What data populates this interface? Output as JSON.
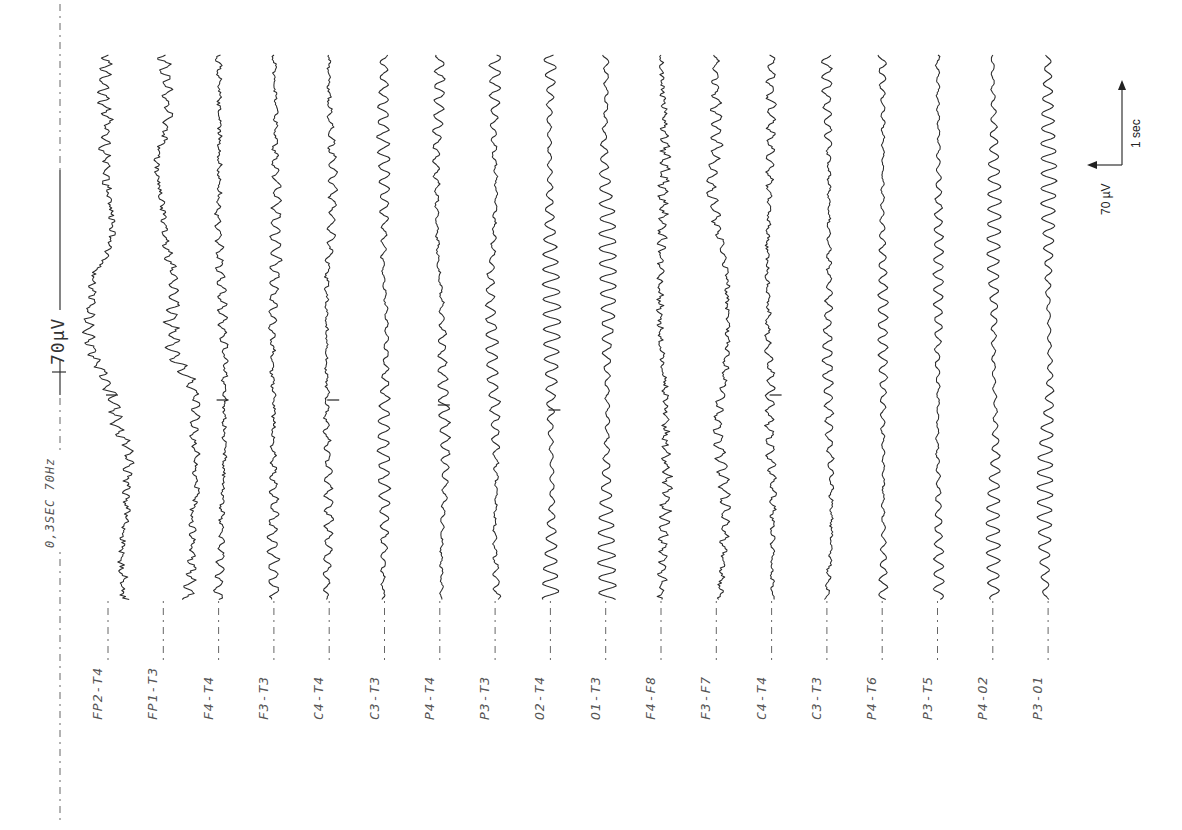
{
  "header": {
    "settings_text": "0,3SEC 70Hz",
    "calibration_text": "70µV"
  },
  "scale_bar": {
    "amplitude_label": "70 µV",
    "time_label": "1 sec"
  },
  "chart_data": {
    "type": "line",
    "orientation": "rotated-90-ccw",
    "time_constant": "0,3SEC",
    "high_filter": "70Hz",
    "calibration": "70µV",
    "scale_bar": {
      "amplitude_uV": 70,
      "time_sec": 1
    },
    "grid": false,
    "legend": "none",
    "channels": [
      {
        "label": "FP2-T4",
        "character": "low-amplitude fast activity with slow drift artifact",
        "amplitude": 5,
        "freq": 0.55,
        "noise": 0.9,
        "drift": 9,
        "mark": 395
      },
      {
        "label": "FP1-T3",
        "character": "mixed fast activity with slow eye-movement drift",
        "amplitude": 6,
        "freq": 0.5,
        "noise": 0.8,
        "drift": 8
      },
      {
        "label": "F4-T4",
        "character": "low-amplitude mixed frequency",
        "amplitude": 4,
        "freq": 0.45,
        "noise": 0.6,
        "drift": 2,
        "mark": 400
      },
      {
        "label": "F3-T3",
        "character": "low-amplitude alpha intermixed",
        "amplitude": 5,
        "freq": 0.42,
        "noise": 0.45,
        "drift": 2
      },
      {
        "label": "C4-T4",
        "character": "low-amplitude, sparse alpha",
        "amplitude": 4,
        "freq": 0.4,
        "noise": 0.45,
        "drift": 1.5,
        "mark": 400
      },
      {
        "label": "C3-T3",
        "character": "alpha rhythm",
        "amplitude": 6,
        "freq": 0.42,
        "noise": 0.3,
        "drift": 1.5
      },
      {
        "label": "P4-T4",
        "character": "alpha rhythm",
        "amplitude": 5,
        "freq": 0.42,
        "noise": 0.3,
        "drift": 1.5,
        "mark": 405
      },
      {
        "label": "P3-T3",
        "character": "alpha rhythm",
        "amplitude": 6,
        "freq": 0.42,
        "noise": 0.3,
        "drift": 1.5
      },
      {
        "label": "O2-T4",
        "character": "prominent posterior alpha rhythm",
        "amplitude": 9,
        "freq": 0.42,
        "noise": 0.15,
        "drift": 1,
        "mark": 410
      },
      {
        "label": "O1-T3",
        "character": "prominent posterior alpha rhythm",
        "amplitude": 9,
        "freq": 0.42,
        "noise": 0.2,
        "drift": 1.5
      },
      {
        "label": "F4-F8",
        "character": "low-amplitude fast activity",
        "amplitude": 4,
        "freq": 0.55,
        "noise": 0.85,
        "drift": 1.5
      },
      {
        "label": "F3-F7",
        "character": "mixed activity with slow transients",
        "amplitude": 5,
        "freq": 0.45,
        "noise": 0.6,
        "drift": 5
      },
      {
        "label": "C4-T4",
        "character": "low-amplitude, calibration mark",
        "amplitude": 4,
        "freq": 0.42,
        "noise": 0.5,
        "drift": 1.5,
        "mark": 395
      },
      {
        "label": "C3-T3",
        "character": "alpha rhythm",
        "amplitude": 5,
        "freq": 0.42,
        "noise": 0.35,
        "drift": 1.5
      },
      {
        "label": "P4-T6",
        "character": "regular alpha rhythm",
        "amplitude": 5,
        "freq": 0.42,
        "noise": 0.2,
        "drift": 1
      },
      {
        "label": "P3-T5",
        "character": "regular alpha rhythm",
        "amplitude": 5,
        "freq": 0.42,
        "noise": 0.2,
        "drift": 1
      },
      {
        "label": "P4-O2",
        "character": "prominent alpha rhythm",
        "amplitude": 7,
        "freq": 0.42,
        "noise": 0.15,
        "drift": 1
      },
      {
        "label": "P3-O1",
        "character": "prominent alpha rhythm",
        "amplitude": 8,
        "freq": 0.42,
        "noise": 0.12,
        "drift": 1
      }
    ],
    "xlabel": "",
    "ylabel": ""
  },
  "layout": {
    "first_trace_x": 108,
    "trace_spacing": 55.3,
    "trace_top": 55,
    "trace_bottom": 600
  },
  "colors": {
    "trace": "#2a2a2a",
    "label": "#555555",
    "background": "#ffffff"
  }
}
